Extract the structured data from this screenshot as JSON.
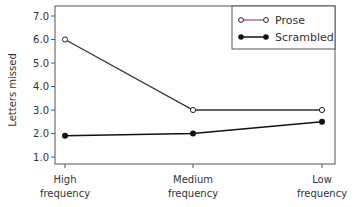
{
  "chart_data": {
    "type": "line",
    "title": "",
    "xlabel": "",
    "ylabel": "Letters missed",
    "categories": [
      [
        "High",
        "frequency"
      ],
      [
        "Medium",
        "frequency"
      ],
      [
        "Low",
        "frequency"
      ]
    ],
    "yticks": [
      "1.0",
      "2.0",
      "3.0",
      "4.0",
      "5.0",
      "6.0",
      "7.0"
    ],
    "ylim": [
      0.7,
      7.2
    ],
    "grid": false,
    "legend_position": "top-right",
    "series": [
      {
        "name": "Prose",
        "marker": "open-circle",
        "line_color": "#8b3a3a",
        "values": [
          6.0,
          3.0,
          3.0
        ]
      },
      {
        "name": "Scrambled",
        "marker": "filled-circle",
        "line_color": "#111111",
        "values": [
          1.9,
          2.0,
          2.5
        ]
      }
    ]
  },
  "colors": {
    "axis": "#444444",
    "prose_line": "#333333",
    "prose_legend_line": "#a05050",
    "scrambled_line": "#111111"
  }
}
